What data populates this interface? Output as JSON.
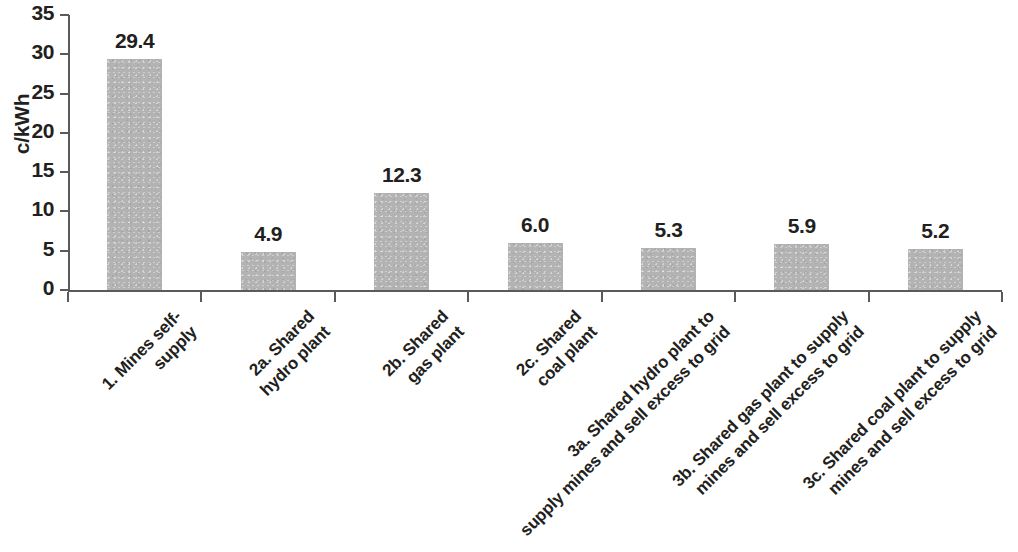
{
  "chart_data": {
    "type": "bar",
    "title": "",
    "subtitle": "",
    "xlabel": "",
    "ylabel": "c/kWh",
    "ylim": [
      0,
      35
    ],
    "ytick_step": 5,
    "yticks": [
      "0",
      "5",
      "10",
      "15",
      "20",
      "25",
      "30",
      "35"
    ],
    "grid": false,
    "legend": "none",
    "bar_color": "#b3b3b3",
    "axis_color": "#5a5a5a",
    "text_color": "#231f20",
    "categories": [
      "1. Mines self-\nsupply",
      "2a. Shared\nhydro plant",
      "2b. Shared\ngas plant",
      "2c. Shared\ncoal plant",
      "3a. Shared hydro plant to\nsupply mines and sell excess to grid",
      "3b. Shared gas plant to supply\nmines and sell excess to grid",
      "3c. Shared coal plant to supply\nmines and sell excess to grid"
    ],
    "values": [
      29.4,
      4.9,
      12.3,
      6.0,
      5.3,
      5.9,
      5.2
    ],
    "value_labels": [
      "29.4",
      "4.9",
      "12.3",
      "6.0",
      "5.3",
      "5.9",
      "5.2"
    ]
  }
}
